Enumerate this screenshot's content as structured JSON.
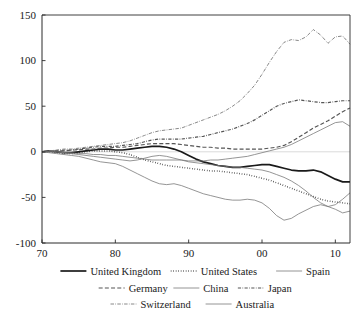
{
  "chart_data": {
    "type": "line",
    "title": "",
    "xlabel": "",
    "ylabel": "",
    "xlim": [
      70,
      112
    ],
    "ylim": [
      -100,
      150
    ],
    "grid": false,
    "zero_line": true,
    "legend_position": "bottom",
    "x_ticks": [
      "70",
      "80",
      "90",
      "00",
      "10"
    ],
    "x_tick_values": [
      70,
      80,
      90,
      100,
      110
    ],
    "y_ticks": [
      "150",
      "100",
      "50",
      "0",
      "-50",
      "-100"
    ],
    "y_tick_values": [
      150,
      100,
      50,
      0,
      -50,
      -100
    ],
    "x": [
      70,
      71,
      72,
      73,
      74,
      75,
      76,
      77,
      78,
      79,
      80,
      81,
      82,
      83,
      84,
      85,
      86,
      87,
      88,
      89,
      90,
      91,
      92,
      93,
      94,
      95,
      96,
      97,
      98,
      99,
      100,
      101,
      102,
      103,
      104,
      105,
      106,
      107,
      108,
      109,
      110,
      111,
      112
    ],
    "series": [
      {
        "name": "United Kingdom",
        "style": "solid-thick",
        "values": [
          0,
          1,
          0,
          -1,
          -1,
          0,
          1,
          2,
          3,
          3,
          2,
          2,
          3,
          4,
          5,
          6,
          6,
          5,
          3,
          0,
          -4,
          -8,
          -11,
          -13,
          -15,
          -16,
          -17,
          -17,
          -16,
          -15,
          -14,
          -14,
          -16,
          -18,
          -20,
          -21,
          -21,
          -20,
          -22,
          -26,
          -30,
          -33,
          -33
        ]
      },
      {
        "name": "United States",
        "style": "dotted",
        "values": [
          0,
          0,
          -1,
          -2,
          -2,
          -1,
          0,
          1,
          1,
          1,
          0,
          -1,
          -3,
          -6,
          -9,
          -11,
          -13,
          -15,
          -16,
          -17,
          -18,
          -19,
          -20,
          -21,
          -21,
          -22,
          -23,
          -24,
          -25,
          -27,
          -29,
          -31,
          -34,
          -37,
          -40,
          -43,
          -46,
          -49,
          -52,
          -54,
          -55,
          -56,
          -57
        ]
      },
      {
        "name": "Spain",
        "style": "solid-thin",
        "values": [
          0,
          0,
          0,
          -1,
          -2,
          -3,
          -4,
          -5,
          -6,
          -7,
          -8,
          -9,
          -10,
          -9,
          -7,
          -5,
          -4,
          -5,
          -7,
          -9,
          -11,
          -12,
          -13,
          -14,
          -15,
          -16,
          -17,
          -17,
          -18,
          -19,
          -20,
          -22,
          -25,
          -28,
          -32,
          -37,
          -43,
          -50,
          -56,
          -60,
          -58,
          -52,
          -45
        ]
      },
      {
        "name": "Germany",
        "style": "dashed",
        "values": [
          0,
          1,
          1,
          1,
          2,
          2,
          3,
          3,
          4,
          4,
          5,
          5,
          6,
          7,
          8,
          9,
          9,
          9,
          9,
          8,
          7,
          6,
          5,
          5,
          4,
          4,
          3,
          3,
          3,
          3,
          3,
          4,
          5,
          7,
          11,
          16,
          21,
          26,
          30,
          34,
          39,
          44,
          48
        ]
      },
      {
        "name": "China",
        "style": "solid-thin",
        "values": [
          0,
          0,
          0,
          -1,
          -1,
          -2,
          -2,
          -3,
          -3,
          -4,
          -4,
          -5,
          -6,
          -7,
          -8,
          -9,
          -9,
          -9,
          -9,
          -9,
          -10,
          -10,
          -10,
          -9,
          -9,
          -8,
          -7,
          -6,
          -5,
          -3,
          -1,
          1,
          3,
          5,
          8,
          12,
          16,
          20,
          24,
          28,
          32,
          33,
          28
        ]
      },
      {
        "name": "Japan",
        "style": "dash-dot",
        "values": [
          0,
          1,
          1,
          2,
          2,
          3,
          4,
          5,
          6,
          6,
          6,
          7,
          8,
          9,
          11,
          13,
          14,
          14,
          14,
          14,
          15,
          16,
          17,
          19,
          21,
          23,
          25,
          28,
          31,
          35,
          40,
          45,
          50,
          53,
          55,
          57,
          56,
          55,
          54,
          54,
          55,
          56,
          56
        ]
      },
      {
        "name": "Switzerland",
        "style": "dash-dot-fine",
        "values": [
          0,
          1,
          2,
          3,
          3,
          4,
          5,
          6,
          7,
          8,
          9,
          10,
          12,
          15,
          18,
          21,
          23,
          24,
          25,
          26,
          29,
          32,
          35,
          38,
          41,
          45,
          50,
          56,
          64,
          73,
          85,
          98,
          110,
          120,
          123,
          122,
          126,
          134,
          128,
          119,
          126,
          127,
          118
        ]
      },
      {
        "name": "Australia",
        "style": "solid-thin",
        "values": [
          0,
          -1,
          -2,
          -3,
          -4,
          -5,
          -7,
          -9,
          -11,
          -12,
          -13,
          -16,
          -20,
          -24,
          -28,
          -32,
          -35,
          -36,
          -35,
          -37,
          -40,
          -43,
          -46,
          -48,
          -50,
          -52,
          -53,
          -53,
          -52,
          -53,
          -56,
          -62,
          -70,
          -75,
          -73,
          -68,
          -64,
          -60,
          -58,
          -60,
          -63,
          -67,
          -65
        ]
      }
    ]
  },
  "legend": {
    "rows": [
      [
        {
          "label": "United Kingdom",
          "style": "solid-thick"
        },
        {
          "label": "United States",
          "style": "dotted"
        },
        {
          "label": "Spain",
          "style": "solid-thin"
        }
      ],
      [
        {
          "label": "Germany",
          "style": "dashed"
        },
        {
          "label": "China",
          "style": "solid-thin"
        },
        {
          "label": "Japan",
          "style": "dash-dot"
        }
      ],
      [
        {
          "label": "Switzerland",
          "style": "dash-dot-fine"
        },
        {
          "label": "Australia",
          "style": "solid-thin"
        }
      ]
    ]
  },
  "colors": {
    "axis": "#2b2b2b",
    "text": "#1a1a1a",
    "line_dark": "#1a1a1a",
    "line_mid": "#555555",
    "line_light": "#7a7a7a",
    "zero_line": "#bfbfbf",
    "background": "#ffffff"
  }
}
